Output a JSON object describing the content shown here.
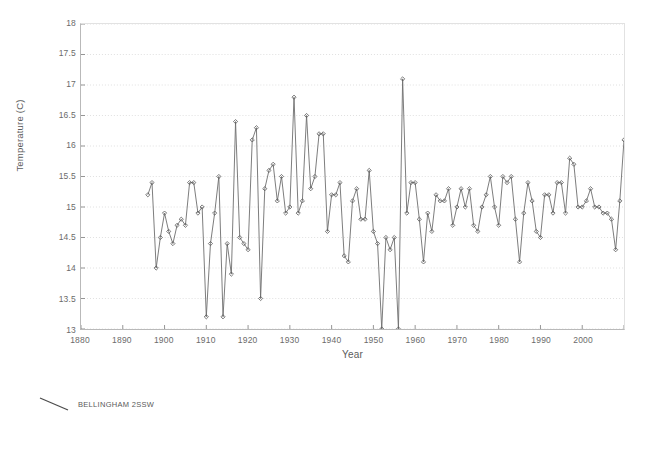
{
  "chart_data": {
    "type": "line",
    "title": "",
    "xlabel": "Year",
    "ylabel": "Temperature (C)",
    "xlim": [
      1880,
      2010
    ],
    "ylim": [
      13,
      18
    ],
    "ytick_step": 0.5,
    "xtick_step": 10,
    "grid": true,
    "legend_position": "below-plot",
    "marker": "diamond",
    "line_color": "#6e6e6e",
    "marker_color": "#5a5a5a",
    "grid_color": "#d8d8d8",
    "series": [
      {
        "name": "BELLINGHAM 2SSW",
        "x": [
          1896,
          1897,
          1898,
          1899,
          1900,
          1901,
          1902,
          1903,
          1904,
          1905,
          1906,
          1907,
          1908,
          1909,
          1910,
          1911,
          1912,
          1913,
          1914,
          1915,
          1916,
          1917,
          1918,
          1919,
          1920,
          1921,
          1922,
          1923,
          1924,
          1925,
          1926,
          1927,
          1928,
          1929,
          1930,
          1931,
          1932,
          1933,
          1934,
          1935,
          1936,
          1937,
          1938,
          1939,
          1940,
          1941,
          1942,
          1943,
          1944,
          1945,
          1946,
          1947,
          1948,
          1949,
          1950,
          1951,
          1952,
          1953,
          1954,
          1955,
          1956,
          1957,
          1958,
          1959,
          1960,
          1961,
          1962,
          1963,
          1964,
          1965,
          1966,
          1967,
          1968,
          1969,
          1970,
          1971,
          1972,
          1973,
          1974,
          1975,
          1976,
          1977,
          1978,
          1979,
          1980,
          1981,
          1982,
          1983,
          1984,
          1985,
          1986,
          1987,
          1988,
          1989,
          1990,
          1991,
          1992,
          1993,
          1994,
          1995,
          1996,
          1997,
          1998,
          1999,
          2000,
          2001,
          2002,
          2003,
          2004,
          2005,
          2006,
          2007,
          2008,
          2009,
          2010
        ],
        "values": [
          15.2,
          15.4,
          14.0,
          14.5,
          14.9,
          14.6,
          14.4,
          14.7,
          14.8,
          14.7,
          15.4,
          15.4,
          14.9,
          15.0,
          13.2,
          14.4,
          14.9,
          15.5,
          13.2,
          14.4,
          13.9,
          16.4,
          14.5,
          14.4,
          14.3,
          16.1,
          16.3,
          13.5,
          15.3,
          15.6,
          15.7,
          15.1,
          15.5,
          14.9,
          15.0,
          16.8,
          14.9,
          15.1,
          16.5,
          15.3,
          15.5,
          16.2,
          16.2,
          14.6,
          15.2,
          15.2,
          15.4,
          14.2,
          14.1,
          15.1,
          15.3,
          14.8,
          14.8,
          15.6,
          14.6,
          14.4,
          13.0,
          14.5,
          14.3,
          14.5,
          13.0,
          17.1,
          14.9,
          15.4,
          15.4,
          14.8,
          14.1,
          14.9,
          14.6,
          15.2,
          15.1,
          15.1,
          15.3,
          14.7,
          15.0,
          15.3,
          15.0,
          15.3,
          14.7,
          14.6,
          15.0,
          15.2,
          15.5,
          15.0,
          14.7,
          15.5,
          15.4,
          15.5,
          14.8,
          14.1,
          14.9,
          15.4,
          15.1,
          14.6,
          14.5,
          15.2,
          15.2,
          14.9,
          15.4,
          15.4,
          14.9,
          15.8,
          15.7,
          15.0,
          15.0,
          15.1,
          15.3,
          15.0,
          15.0,
          14.9,
          14.9,
          14.8,
          14.3,
          15.1,
          16.1
        ]
      }
    ],
    "ytick_labels": [
      "18",
      "17.5",
      "17",
      "16.5",
      "16",
      "15.5",
      "15",
      "14.5",
      "14",
      "13.5",
      "13"
    ],
    "xtick_labels": [
      "1880",
      "1890",
      "1900",
      "1910",
      "1920",
      "1930",
      "1940",
      "1950",
      "1960",
      "1970",
      "1980",
      "1990",
      "2000"
    ]
  },
  "legend": {
    "label": "BELLINGHAM 2SSW"
  }
}
